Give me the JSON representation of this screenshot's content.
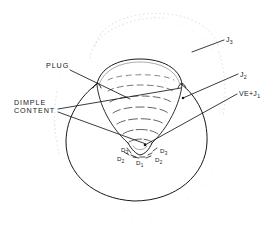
{
  "figure": {
    "background_color": "#ffffff",
    "ink_color": "#17181a",
    "faint_color": "#b9bcc1",
    "width": 277,
    "height": 242
  },
  "callouts": {
    "dimple_content_line1": "DIMPLE",
    "dimple_content_line2": "CONTENT",
    "plug": "PLUG"
  },
  "flux_labels": {
    "j3_base": "J",
    "j3_sub": "3",
    "j2_base": "J",
    "j2_sub": "2",
    "ve_j1_base": "VE+J",
    "ve_j1_sub": "1"
  },
  "drainage_markers": [
    {
      "id": "d3-left",
      "base": "D",
      "sub": "3"
    },
    {
      "id": "d2-left",
      "base": "D",
      "sub": "2"
    },
    {
      "id": "d1",
      "base": "D",
      "sub": "1"
    },
    {
      "id": "d2-right",
      "base": "D",
      "sub": "2"
    },
    {
      "id": "d3-right",
      "base": "D",
      "sub": "3"
    }
  ]
}
